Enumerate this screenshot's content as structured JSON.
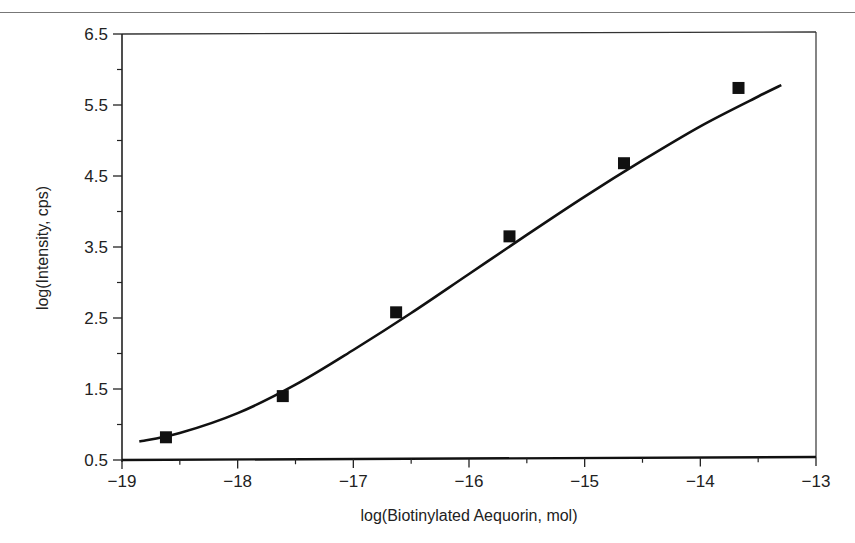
{
  "chart_data": {
    "type": "scatter",
    "title": "",
    "xlabel": "log(Biotinylated Aequorin, mol)",
    "ylabel": "log(Intensity, cps)",
    "xlim": [
      -19,
      -13
    ],
    "ylim": [
      0.5,
      6.5
    ],
    "x_ticks": [
      -19,
      -18,
      -17,
      -16,
      -15,
      -14,
      -13
    ],
    "x_tick_labels": [
      "−19",
      "−18",
      "−17",
      "−16",
      "−15",
      "−14",
      "−13"
    ],
    "y_ticks": [
      0.5,
      1.5,
      2.5,
      3.5,
      4.5,
      5.5,
      6.5
    ],
    "y_tick_labels": [
      "0.5",
      "1.5",
      "2.5",
      "3.5",
      "4.5",
      "5.5",
      "6.5"
    ],
    "grid": false,
    "legend": null,
    "series": [
      {
        "name": "measured",
        "marker": "square",
        "color": "#111111",
        "x": [
          -18.62,
          -17.61,
          -16.63,
          -15.65,
          -14.66,
          -13.67
        ],
        "y": [
          0.82,
          1.4,
          2.58,
          3.65,
          4.68,
          5.74
        ]
      },
      {
        "name": "fit",
        "style": "line",
        "color": "#111111",
        "x": [
          -18.85,
          -18.5,
          -18.0,
          -17.5,
          -17.0,
          -16.5,
          -16.0,
          -15.5,
          -15.0,
          -14.5,
          -14.0,
          -13.5,
          -13.3
        ],
        "y": [
          0.76,
          0.88,
          1.16,
          1.56,
          2.05,
          2.57,
          3.12,
          3.67,
          4.21,
          4.72,
          5.2,
          5.62,
          5.78
        ]
      }
    ]
  }
}
